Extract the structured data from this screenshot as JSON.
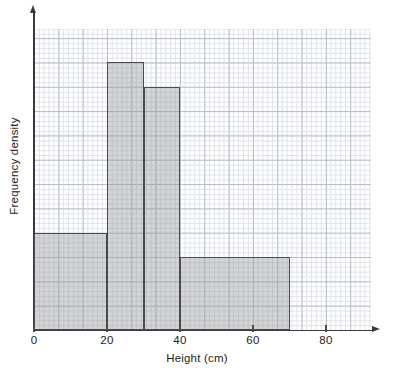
{
  "figure": {
    "name": "histogram-frequency-density-height",
    "background_color": "#ffffff",
    "grid_color_minor": "#dfe3e9",
    "grid_color_major": "#b9bfc9",
    "axis_color": "#3a3a3c",
    "bar_fill_color": "#96989c",
    "bar_edge_color": "#4a4a4c",
    "top_cropped_text": ""
  },
  "chart_data": {
    "type": "bar",
    "title": "",
    "subtitle": "",
    "xlabel": "Height (cm)",
    "ylabel": "Frequency density",
    "grid": true,
    "grid_style": "graph-paper (minor squares with major line every 5)",
    "legend": false,
    "legend_position": "none",
    "xlim": [
      0,
      92
    ],
    "ylim": [
      0,
      2.48
    ],
    "xticks": [
      0,
      20,
      40,
      60,
      80
    ],
    "xtick_labels": [
      "0",
      "20",
      "40",
      "60",
      "80"
    ],
    "yticks": [],
    "ytick_labels": [],
    "y_major_gridline_step": 0.2,
    "bins": [
      {
        "label": "0-20",
        "x_start": 0,
        "x_end": 20,
        "width": 20,
        "value": 0.8,
        "frequency": 16
      },
      {
        "label": "20-30",
        "x_start": 20,
        "x_end": 30,
        "width": 10,
        "value": 2.2,
        "frequency": 22
      },
      {
        "label": "30-40",
        "x_start": 30,
        "x_end": 40,
        "width": 10,
        "value": 2.0,
        "frequency": 20
      },
      {
        "label": "40-70",
        "x_start": 40,
        "x_end": 70,
        "width": 30,
        "value": 0.6,
        "frequency": 18
      }
    ],
    "categories": [
      "0-20",
      "20-30",
      "30-40",
      "40-70"
    ],
    "values": [
      0.8,
      2.2,
      2.0,
      0.6
    ],
    "bar_edges": [
      0,
      20,
      30,
      40,
      70
    ],
    "annotations": []
  },
  "axes": {
    "x": {
      "title": "Height (cm)",
      "ticks": [
        {
          "label": "0",
          "value": 0
        },
        {
          "label": "20",
          "value": 20
        },
        {
          "label": "40",
          "value": 40
        },
        {
          "label": "60",
          "value": 60
        },
        {
          "label": "80",
          "value": 80
        }
      ],
      "arrow": "right-arrow-icon"
    },
    "y": {
      "title": "Frequency density",
      "ticks": [],
      "arrow": "up-arrow-icon"
    }
  }
}
